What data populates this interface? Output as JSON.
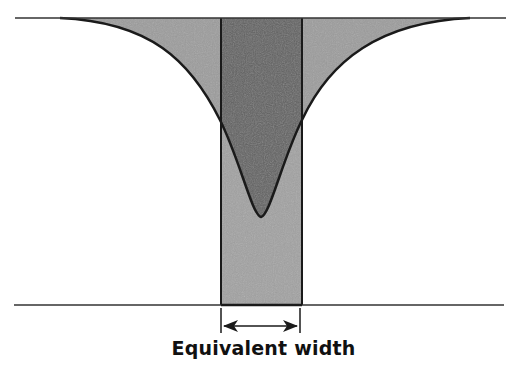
{
  "diagram": {
    "title": "Equivalent width",
    "label": "Equivalent width",
    "colors": {
      "background": "#ffffff",
      "line_fill": "#9a9a9a",
      "rect_fill_upper": "#6a6a6a",
      "rect_fill_lower": "#a0a0a0",
      "stroke": "#1a1a1a"
    },
    "elements": [
      "continuum-line",
      "absorption-line-profile",
      "equivalent-width-rectangle",
      "baseline",
      "width-arrow"
    ]
  }
}
